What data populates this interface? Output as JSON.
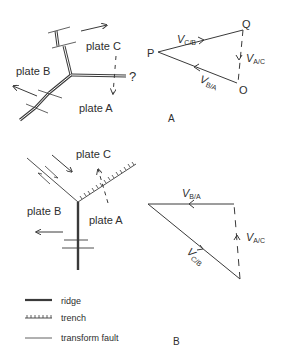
{
  "diagram_a": {
    "plate_labels": {
      "plate_c": "plate C",
      "plate_b": "plate B",
      "plate_a": "plate A"
    },
    "unknown_marker": "?",
    "triangle": {
      "vertices": {
        "p": "P",
        "q": "Q",
        "o": "O"
      },
      "vectors": {
        "v_cb": {
          "main": "V",
          "sub": "C/B"
        },
        "v_ac": {
          "main": "V",
          "sub": "A/C"
        },
        "v_ba": {
          "main": "V",
          "sub": "B/A"
        }
      }
    },
    "section_label": "A"
  },
  "diagram_b": {
    "plate_labels": {
      "plate_c": "plate C",
      "plate_b": "plate B",
      "plate_a": "plate A"
    },
    "triangle": {
      "vectors": {
        "v_ba": {
          "main": "V",
          "sub": "B/A"
        },
        "v_ac": {
          "main": "V",
          "sub": "A/C"
        },
        "v_cb": {
          "main": "V",
          "sub": "C/B"
        }
      }
    },
    "section_label": "B"
  },
  "legend": {
    "items": [
      {
        "symbol": "ridge",
        "label": "ridge"
      },
      {
        "symbol": "trench",
        "label": "trench"
      },
      {
        "symbol": "transform-fault",
        "label": "transform fault"
      }
    ]
  },
  "colors": {
    "line": "#3a3a3a",
    "text": "#2e2e2e",
    "background": "#ffffff"
  }
}
